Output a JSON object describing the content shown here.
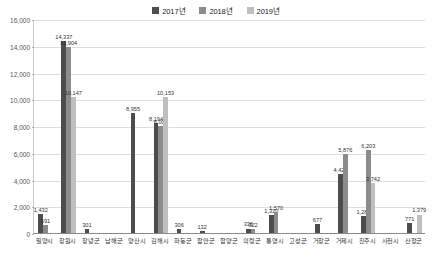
{
  "chart_data": {
    "type": "bar",
    "title": "",
    "subtitle": "",
    "xlabel": "",
    "ylabel": "",
    "ylim": [
      0,
      16000
    ],
    "ytick_step": 2000,
    "ytick_labels": [
      "0",
      "2,000",
      "4,000",
      "6,000",
      "8,000",
      "10,000",
      "12,000",
      "14,000",
      "16,000"
    ],
    "ytick_values": [
      0,
      2000,
      4000,
      6000,
      8000,
      10000,
      12000,
      14000,
      16000
    ],
    "grid": true,
    "legend_position": "top-center",
    "categories": [
      "밀양시",
      "창원시",
      "창녕군",
      "남해군",
      "양산시",
      "김해시",
      "하동군",
      "함안군",
      "함양군",
      "의령군",
      "통영시",
      "고성군",
      "거창군",
      "거제시",
      "진주시",
      "사천시",
      "산청군"
    ],
    "series": [
      {
        "name": "2017년",
        "color": "#4d4d4d",
        "values": [
          1432,
          14337,
          301,
          0,
          8955,
          8194,
          306,
          132,
          0,
          336,
          1320,
          0,
          677,
          4428,
          1286,
          0,
          771
        ]
      },
      {
        "name": "2018년",
        "color": "#8c8c8c",
        "values": [
          591,
          13904,
          0,
          0,
          0,
          8008,
          0,
          0,
          0,
          322,
          1570,
          0,
          0,
          5876,
          6203,
          0,
          0
        ]
      },
      {
        "name": "2019년",
        "color": "#bfbfbf",
        "values": [
          0,
          10147,
          0,
          0,
          0,
          10153,
          0,
          0,
          0,
          0,
          0,
          0,
          0,
          0,
          3742,
          0,
          1379
        ]
      }
    ],
    "data_labels": [
      {
        "category": "밀양시",
        "series": "2017년",
        "text": "1,432"
      },
      {
        "category": "밀양시",
        "series": "2018년",
        "text": "591"
      },
      {
        "category": "창원시",
        "series": "2017년",
        "text": "14,337"
      },
      {
        "category": "창원시",
        "series": "2018년",
        "text": "13,904"
      },
      {
        "category": "창원시",
        "series": "2019년",
        "text": "10,147"
      },
      {
        "category": "창녕군",
        "series": "2017년",
        "text": "301"
      },
      {
        "category": "양산시",
        "series": "2017년",
        "text": "8,955"
      },
      {
        "category": "김해시",
        "series": "2017년",
        "text": "8,194"
      },
      {
        "category": "김해시",
        "series": "2018년",
        "text": "8,008"
      },
      {
        "category": "김해시",
        "series": "2019년",
        "text": "10,153"
      },
      {
        "category": "하동군",
        "series": "2017년",
        "text": "306"
      },
      {
        "category": "함안군",
        "series": "2017년",
        "text": "132"
      },
      {
        "category": "의령군",
        "series": "2017년",
        "text": "336"
      },
      {
        "category": "의령군",
        "series": "2018년",
        "text": "322"
      },
      {
        "category": "통영시",
        "series": "2017년",
        "text": "1,320"
      },
      {
        "category": "통영시",
        "series": "2018년",
        "text": "1,570"
      },
      {
        "category": "거창군",
        "series": "2017년",
        "text": "677"
      },
      {
        "category": "거제시",
        "series": "2017년",
        "text": "4,428"
      },
      {
        "category": "거제시",
        "series": "2018년",
        "text": "5,876"
      },
      {
        "category": "진주시",
        "series": "2017년",
        "text": "1,286"
      },
      {
        "category": "진주시",
        "series": "2018년",
        "text": "6,203"
      },
      {
        "category": "진주시",
        "series": "2019년",
        "text": "3,742"
      },
      {
        "category": "산청군",
        "series": "2017년",
        "text": "771"
      },
      {
        "category": "산청군",
        "series": "2019년",
        "text": "1,379"
      }
    ]
  },
  "legend": {
    "entries": [
      {
        "label": "2017년",
        "color": "#4d4d4d"
      },
      {
        "label": "2018년",
        "color": "#8c8c8c"
      },
      {
        "label": "2019년",
        "color": "#bfbfbf"
      }
    ]
  }
}
